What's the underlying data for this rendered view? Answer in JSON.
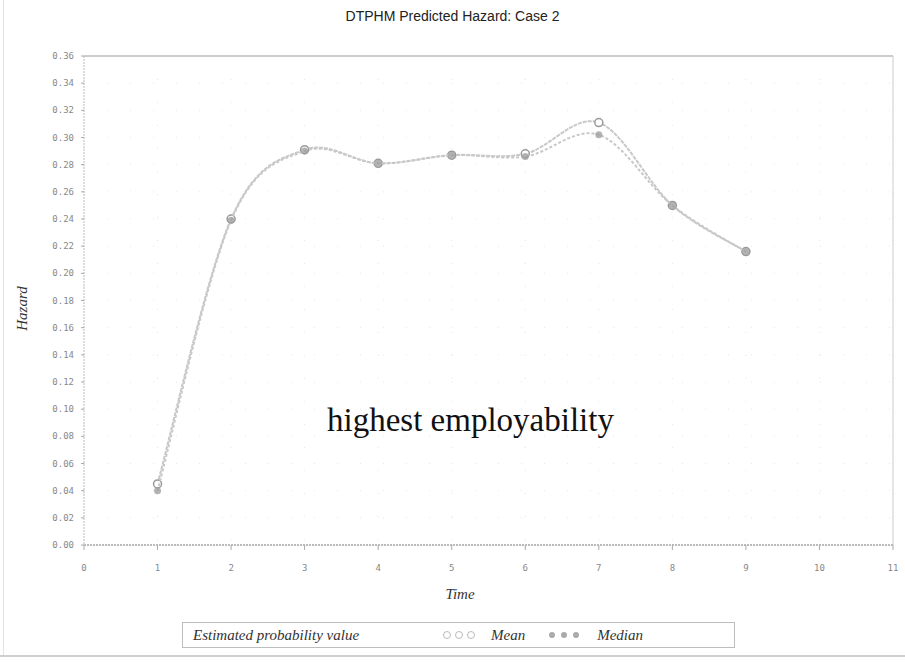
{
  "title": "DTPHM Predicted Hazard: Case 2",
  "annotation": "highest employability",
  "axes": {
    "xlabel": "Time",
    "ylabel": "Hazard",
    "xticks": [
      "0",
      "1",
      "2",
      "3",
      "4",
      "5",
      "6",
      "7",
      "8",
      "9",
      "10",
      "11"
    ],
    "yticks": [
      "0.00",
      "0.02",
      "0.04",
      "0.06",
      "0.08",
      "0.10",
      "0.12",
      "0.14",
      "0.16",
      "0.18",
      "0.20",
      "0.22",
      "0.24",
      "0.26",
      "0.28",
      "0.30",
      "0.32",
      "0.34",
      "0.36"
    ]
  },
  "legend": {
    "title": "Estimated probability value",
    "items": [
      {
        "label": "Mean",
        "symbol": "open-circle"
      },
      {
        "label": "Median",
        "symbol": "filled-circle"
      }
    ]
  },
  "colors": {
    "line": "#c8c8c8",
    "marker": "#9a9a9a",
    "grid": "#e6e6e6",
    "frame": "#cccccc"
  },
  "chart_data": {
    "type": "line",
    "title": "DTPHM Predicted Hazard: Case 2",
    "xlabel": "Time",
    "ylabel": "Hazard",
    "xlim": [
      0,
      11
    ],
    "ylim": [
      0,
      0.36
    ],
    "grid": true,
    "legend_position": "bottom",
    "legend_title": "Estimated probability value",
    "annotations": [
      {
        "text": "highest employability",
        "x": 5.5,
        "y": 0.09
      }
    ],
    "x": [
      1,
      2,
      3,
      4,
      5,
      6,
      7,
      8,
      9
    ],
    "series": [
      {
        "name": "Mean",
        "values": [
          0.045,
          0.24,
          0.291,
          0.281,
          0.287,
          0.288,
          0.311,
          0.25,
          0.216
        ]
      },
      {
        "name": "Median",
        "values": [
          0.04,
          0.239,
          0.29,
          0.281,
          0.287,
          0.286,
          0.302,
          0.25,
          0.216
        ]
      }
    ]
  }
}
